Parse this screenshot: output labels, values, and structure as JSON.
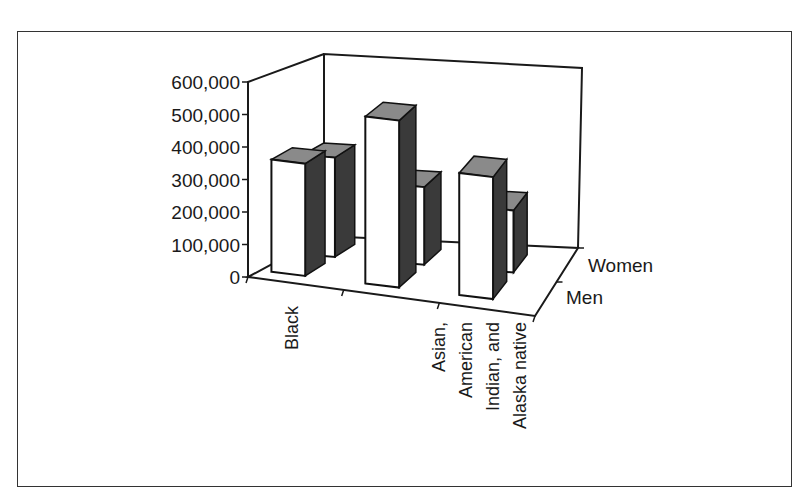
{
  "chart_data": {
    "type": "bar",
    "style": "3d-clustered-depth",
    "title": "",
    "xlabel": "",
    "ylabel": "",
    "categories": [
      "Black",
      "",
      "Asian, American Indian, and Alaska native"
    ],
    "category_label_lines": [
      [
        "Black"
      ],
      [],
      [
        "Asian,",
        "American",
        "Indian, and",
        "Alaska native"
      ]
    ],
    "series": [
      {
        "name": "Men",
        "values": [
          350000,
          520000,
          380000
        ]
      },
      {
        "name": "Women",
        "values": [
          320000,
          250000,
          200000
        ]
      }
    ],
    "ylim": [
      0,
      600000
    ],
    "yticks": [
      0,
      100000,
      200000,
      300000,
      400000,
      500000,
      600000
    ],
    "ytick_labels": [
      "0",
      "100,000",
      "200,000",
      "300,000",
      "400,000",
      "500,000",
      "600,000"
    ],
    "depth_axis_labels": [
      "Women",
      "Men"
    ],
    "grid": false,
    "legend": "none (series named on depth axis)"
  },
  "colors": {
    "bar_front": "#ffffff",
    "bar_side": "#3a3a3a",
    "bar_top": "#8a8a8a",
    "axis": "#1a1a1a"
  }
}
